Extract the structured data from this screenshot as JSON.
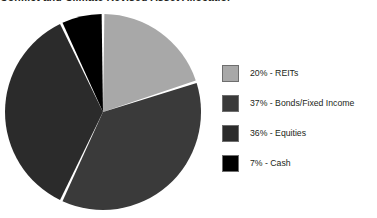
{
  "chart_data": {
    "type": "pie",
    "title": "Conflict and Climate Revised Asset Allocation",
    "categories": [
      "REITs",
      "Bonds/Fixed Income",
      "Equities",
      "Cash"
    ],
    "values": [
      20,
      37,
      36,
      7
    ],
    "value_unit": "%",
    "colors": [
      "#a8a8a8",
      "#3a3a3a",
      "#2b2b2b",
      "#000000"
    ],
    "legend_position": "right",
    "grid": false,
    "start_angle_deg": 0,
    "direction": "clockwise",
    "slice_gap": true,
    "legend": [
      {
        "label": "20% - REITs",
        "value": 20,
        "name": "REITs",
        "color": "#a8a8a8"
      },
      {
        "label": "37% - Bonds/Fixed Income",
        "value": 37,
        "name": "Bonds/Fixed Income",
        "color": "#3a3a3a"
      },
      {
        "label": "36% - Equities",
        "value": 36,
        "name": "Equities",
        "color": "#2b2b2b"
      },
      {
        "label": "7% - Cash",
        "value": 7,
        "name": "Cash",
        "color": "#000000"
      }
    ]
  },
  "slice_names": [
    "reits",
    "bonds-fixed-income",
    "equities",
    "cash"
  ]
}
